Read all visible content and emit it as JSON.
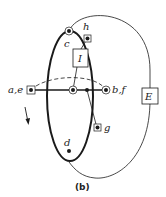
{
  "figure": {
    "caption": "(b)",
    "colors": {
      "stroke": "#1a1a1a",
      "background": "#ffffff"
    },
    "vertices": [
      {
        "id": "ae",
        "label": "a,e",
        "marker": "square-with-dot"
      },
      {
        "id": "center",
        "label": "",
        "marker": "circled-dot"
      },
      {
        "id": "mid",
        "label": "",
        "marker": "dot"
      },
      {
        "id": "bf",
        "label": "b,f",
        "marker": "circled-dot"
      },
      {
        "id": "c",
        "label": "c",
        "marker": "circled-dot"
      },
      {
        "id": "h",
        "label": "h",
        "marker": "square-with-dot"
      },
      {
        "id": "g",
        "label": "g",
        "marker": "square-with-dot"
      },
      {
        "id": "d",
        "label": "d",
        "marker": "dot"
      }
    ],
    "boxes": [
      {
        "id": "I",
        "label": "I"
      },
      {
        "id": "E",
        "label": "E"
      }
    ],
    "arrow": {
      "direction": "down"
    }
  }
}
